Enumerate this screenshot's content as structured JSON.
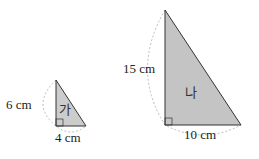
{
  "figure": {
    "triangles": [
      {
        "id": "ga",
        "name": "가",
        "height_label": "6 cm",
        "base_label": "4 cm",
        "height_value": 6,
        "base_value": 4,
        "unit": "cm",
        "fill": "#cccccc"
      },
      {
        "id": "na",
        "name": "나",
        "height_label": "15 cm",
        "base_label": "10 cm",
        "height_value": 15,
        "base_value": 10,
        "unit": "cm",
        "fill": "#c4c4c4"
      }
    ],
    "stroke_color": "#333333",
    "arc_color": "#aaaaaa"
  }
}
